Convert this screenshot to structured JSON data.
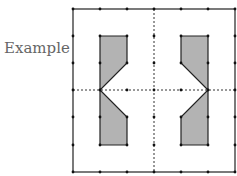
{
  "label": "Example",
  "colors": {
    "line": "#222222",
    "fill": "#b3b3b3",
    "dashed": "#333333",
    "text": "#666666"
  },
  "grid": {
    "x": [
      73,
      100,
      127,
      154,
      181,
      208,
      235
    ],
    "y": [
      9,
      36,
      63,
      90,
      117,
      145,
      172
    ]
  },
  "shapes": {
    "left": "100,36 127,36 127,63 100,90 127,117 127,145 100,145",
    "right": "181,36 208,36 208,145 181,145 181,117 208,90 181,63"
  },
  "axes": {
    "vertical_x": 154,
    "horizontal_y": 90
  }
}
